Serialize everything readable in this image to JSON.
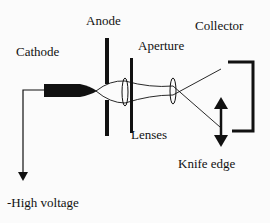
{
  "diagram": {
    "labels": {
      "cathode": "Cathode",
      "anode": "Anode",
      "aperture": "Aperture",
      "collector": "Collector",
      "lenses": "Lenses",
      "knife_edge": "Knife edge",
      "high_voltage": "-High voltage"
    },
    "colors": {
      "ink": "#111111",
      "background": "#fbfbfb"
    }
  }
}
